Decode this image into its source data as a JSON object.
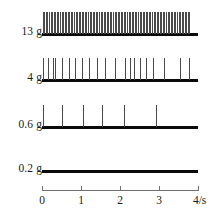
{
  "chart_data": {
    "type": "scatter",
    "title": "",
    "subtitle": "",
    "xlabel": "4/s",
    "ylabel": "",
    "xlim": [
      0,
      4
    ],
    "grid": false,
    "legend": null,
    "x_ticks": [
      {
        "value": 0,
        "label": "0"
      },
      {
        "value": 1,
        "label": "1"
      },
      {
        "value": 2,
        "label": "2"
      },
      {
        "value": 3,
        "label": "3"
      },
      {
        "value": 4,
        "label": "4/s"
      }
    ],
    "axis_unit_note": "seconds",
    "series": [
      {
        "name": "13 g",
        "label": "13 g",
        "stimulus_force_g": 13,
        "spike_count": 95,
        "spike_times": [
          0.02,
          0.06,
          0.1,
          0.14,
          0.18,
          0.22,
          0.26,
          0.3,
          0.34,
          0.38,
          0.42,
          0.46,
          0.5,
          0.54,
          0.58,
          0.62,
          0.66,
          0.7,
          0.74,
          0.78,
          0.82,
          0.86,
          0.9,
          0.94,
          0.98,
          1.02,
          1.06,
          1.1,
          1.14,
          1.18,
          1.22,
          1.26,
          1.3,
          1.34,
          1.38,
          1.42,
          1.46,
          1.5,
          1.54,
          1.58,
          1.62,
          1.66,
          1.7,
          1.74,
          1.78,
          1.82,
          1.86,
          1.9,
          1.94,
          1.98,
          2.02,
          2.06,
          2.1,
          2.14,
          2.18,
          2.22,
          2.26,
          2.3,
          2.34,
          2.38,
          2.42,
          2.46,
          2.5,
          2.54,
          2.58,
          2.62,
          2.66,
          2.7,
          2.74,
          2.78,
          2.82,
          2.86,
          2.9,
          2.94,
          2.98,
          3.02,
          3.06,
          3.1,
          3.14,
          3.18,
          3.22,
          3.26,
          3.3,
          3.34,
          3.38,
          3.42,
          3.46,
          3.5,
          3.54,
          3.58,
          3.62,
          3.66,
          3.7,
          3.74,
          3.78
        ],
        "spike_height_px": 22,
        "baseline_y_px": 33
      },
      {
        "name": "4 g",
        "label": "4 g",
        "stimulus_force_g": 4,
        "spike_count": 21,
        "spike_times": [
          0.02,
          0.16,
          0.27,
          0.34,
          0.52,
          0.68,
          0.85,
          1.02,
          1.2,
          1.41,
          1.62,
          1.88,
          2.12,
          2.26,
          2.37,
          2.5,
          2.66,
          2.85,
          3.12,
          3.55,
          3.78
        ],
        "spike_height_px": 22,
        "baseline_y_px": 79
      },
      {
        "name": "0.6 g",
        "label": "0.6 g",
        "stimulus_force_g": 0.6,
        "spike_count": 6,
        "spike_times": [
          0.03,
          0.52,
          1.05,
          1.53,
          2.1,
          2.93
        ],
        "spike_height_px": 22,
        "baseline_y_px": 126
      },
      {
        "name": "0.2 g",
        "label": "0.2 g",
        "stimulus_force_g": 0.2,
        "spike_count": 0,
        "spike_times": [],
        "spike_height_px": 0,
        "baseline_y_px": 170
      }
    ],
    "colors": {
      "baseline": "#0a0a0a",
      "spike": "#4a4a4a",
      "axis": "#6f6f6f",
      "text": "#1a1a1a",
      "background": "#ffffff"
    }
  }
}
